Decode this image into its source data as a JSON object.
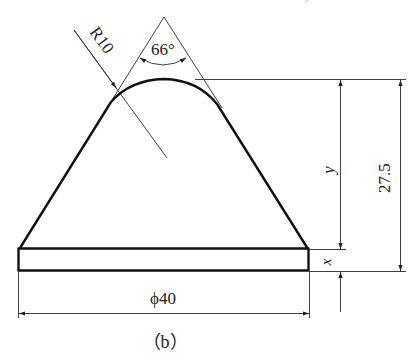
{
  "figure": {
    "caption": "（b）",
    "stroke_color": "#111111",
    "background": "#ffffff"
  },
  "dimensions": {
    "radius": "R10",
    "angle": "66°",
    "height_upper": "y",
    "height_base": "x",
    "total_height": "27.5",
    "diameter": "ϕ40"
  }
}
